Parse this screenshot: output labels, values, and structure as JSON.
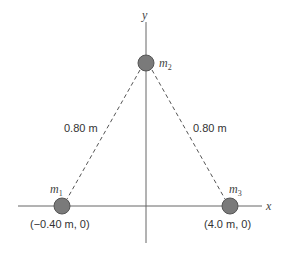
{
  "axes": {
    "x_label": "x",
    "y_label": "y"
  },
  "masses": [
    {
      "name": "m",
      "sub": "1",
      "coord": "(−0.40 m, 0)"
    },
    {
      "name": "m",
      "sub": "2"
    },
    {
      "name": "m",
      "sub": "3",
      "coord": "(4.0 m, 0)"
    }
  ],
  "distances": {
    "left": "0.80 m",
    "right": "0.80 m"
  },
  "colors": {
    "mass_fill": "#7a7a7a",
    "line": "#555555"
  }
}
